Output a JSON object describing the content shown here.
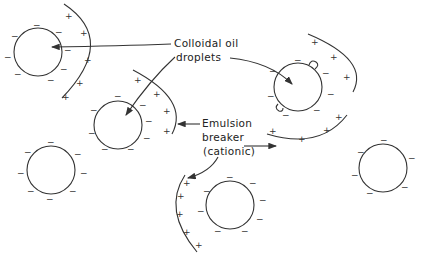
{
  "diagram": {
    "labels": {
      "colloidal_line1": "Colloidal oil",
      "colloidal_line2": "droplets",
      "breaker_line1": "Emulsion",
      "breaker_line2": "breaker",
      "breaker_line3": "(cationic)"
    },
    "signs": {
      "negative": "−",
      "positive": "+"
    },
    "colors": {
      "line": "#333333",
      "background": "#ffffff"
    }
  }
}
